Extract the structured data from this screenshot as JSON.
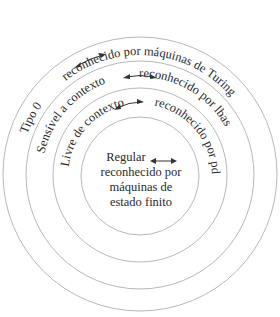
{
  "diagram": {
    "type": "concentric-circles",
    "rings": [
      {
        "name": "Tipo 0",
        "connector": "↔",
        "recognizer": "reconhecido por máquinas de Turing"
      },
      {
        "name": "Sensível a contexto",
        "connector": "↔",
        "recognizer": "reconhecido por lbas"
      },
      {
        "name": "Livre de contexto",
        "connector": "↔",
        "recognizer": "reconhecido por pdas"
      },
      {
        "name": "Regular",
        "connector": "↔",
        "recognizer": "reconhecido por máquinas de estado finito"
      }
    ],
    "center": {
      "line1": "Regular",
      "line2": "reconhecido por",
      "line3": "máquinas de",
      "line4": "estado finito"
    },
    "colors": {
      "ring": "#b8b8b8",
      "text": "#2a2a2a"
    }
  }
}
